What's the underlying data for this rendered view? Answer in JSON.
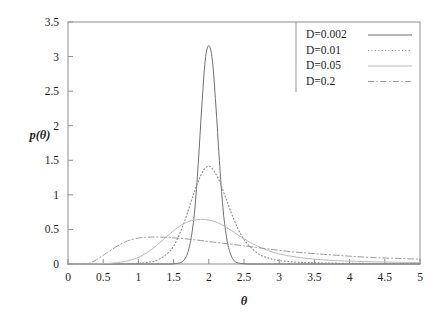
{
  "chart_data": {
    "type": "line",
    "title": "",
    "xlabel": "θ",
    "ylabel": "p(θ)",
    "xlim": [
      0,
      5
    ],
    "ylim": [
      0,
      3.5
    ],
    "xticks": [
      "0",
      "0.5",
      "1",
      "1.5",
      "2",
      "2.5",
      "3",
      "3.5",
      "4",
      "4.5",
      "5"
    ],
    "xtick_values": [
      0,
      0.5,
      1,
      1.5,
      2,
      2.5,
      3,
      3.5,
      4,
      4.5,
      5
    ],
    "yticks": [
      "0",
      "0.5",
      "1",
      "1.5",
      "2",
      "2.5",
      "3",
      "3.5"
    ],
    "ytick_values": [
      0,
      0.5,
      1,
      1.5,
      2,
      2.5,
      3,
      3.5
    ],
    "grid": false,
    "legend_position": "top-right",
    "peak_center": 2.0,
    "series": [
      {
        "name": "D=0.002",
        "linestyle": "solid",
        "color": "#6f6f6f",
        "peak_x": 2.0,
        "peak_y": 3.16,
        "x": [
          0.0,
          0.25,
          0.5,
          0.75,
          1.0,
          1.2,
          1.4,
          1.5,
          1.6,
          1.65,
          1.7,
          1.75,
          1.8,
          1.85,
          1.9,
          1.95,
          2.0,
          2.05,
          2.1,
          2.15,
          2.2,
          2.25,
          2.3,
          2.35,
          2.4,
          2.5,
          2.6,
          2.8,
          3.0,
          3.5,
          4.0,
          4.5,
          5.0
        ],
        "y": [
          0.0,
          0.0,
          0.0,
          0.0,
          0.0,
          0.0,
          0.0,
          0.002,
          0.02,
          0.06,
          0.16,
          0.38,
          0.78,
          1.45,
          2.27,
          2.95,
          3.16,
          2.95,
          2.3,
          1.5,
          0.82,
          0.4,
          0.17,
          0.06,
          0.02,
          0.003,
          0.0,
          0.0,
          0.0,
          0.0,
          0.0,
          0.0,
          0.0
        ]
      },
      {
        "name": "D=0.01",
        "linestyle": "dotted",
        "color": "#8a8a8a",
        "peak_x": 1.98,
        "peak_y": 1.41,
        "x": [
          0.0,
          0.3,
          0.6,
          0.9,
          1.1,
          1.25,
          1.4,
          1.5,
          1.6,
          1.7,
          1.8,
          1.9,
          1.98,
          2.05,
          2.15,
          2.25,
          2.35,
          2.45,
          2.55,
          2.7,
          2.85,
          3.0,
          3.25,
          3.5,
          4.0,
          4.5,
          5.0
        ],
        "y": [
          0.0,
          0.0,
          0.0,
          0.005,
          0.02,
          0.05,
          0.14,
          0.26,
          0.47,
          0.75,
          1.06,
          1.31,
          1.41,
          1.38,
          1.2,
          0.93,
          0.66,
          0.44,
          0.29,
          0.15,
          0.085,
          0.05,
          0.028,
          0.018,
          0.01,
          0.007,
          0.005
        ]
      },
      {
        "name": "D=0.05",
        "linestyle": "solid-light",
        "color": "#b9b9b9",
        "peak_x": 1.88,
        "peak_y": 0.645,
        "x": [
          0.0,
          0.3,
          0.5,
          0.7,
          0.9,
          1.05,
          1.2,
          1.35,
          1.5,
          1.62,
          1.75,
          1.88,
          2.0,
          2.12,
          2.25,
          2.4,
          2.55,
          2.7,
          2.9,
          3.1,
          3.4,
          3.7,
          4.0,
          4.4,
          4.7,
          5.0
        ],
        "y": [
          0.0,
          0.0,
          0.005,
          0.02,
          0.06,
          0.12,
          0.22,
          0.35,
          0.48,
          0.57,
          0.625,
          0.645,
          0.635,
          0.6,
          0.53,
          0.43,
          0.335,
          0.255,
          0.175,
          0.125,
          0.08,
          0.055,
          0.042,
          0.03,
          0.025,
          0.02
        ]
      },
      {
        "name": "D=0.2",
        "linestyle": "dashdot",
        "color": "#9a9a9a",
        "peak_x": 1.22,
        "peak_y": 0.39,
        "x": [
          0.0,
          0.2,
          0.3,
          0.4,
          0.55,
          0.7,
          0.85,
          1.0,
          1.1,
          1.22,
          1.4,
          1.6,
          1.8,
          2.0,
          2.2,
          2.4,
          2.6,
          2.9,
          3.2,
          3.5,
          3.9,
          4.3,
          4.7,
          5.0
        ],
        "y": [
          0.0,
          0.0,
          0.01,
          0.06,
          0.16,
          0.26,
          0.335,
          0.375,
          0.386,
          0.39,
          0.385,
          0.37,
          0.35,
          0.325,
          0.3,
          0.275,
          0.25,
          0.21,
          0.175,
          0.15,
          0.12,
          0.095,
          0.08,
          0.07
        ]
      }
    ]
  },
  "legend": {
    "entries": [
      {
        "label": "D=0.002"
      },
      {
        "label": "D=0.01"
      },
      {
        "label": "D=0.05"
      },
      {
        "label": "D=0.2"
      }
    ]
  },
  "axes": {
    "x_title": "θ",
    "y_title": "p(θ)"
  }
}
